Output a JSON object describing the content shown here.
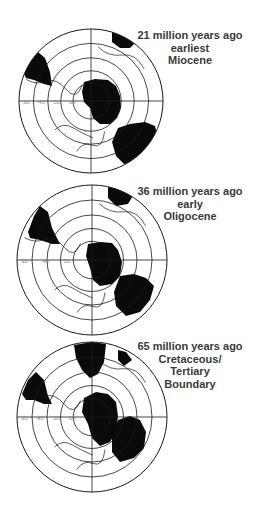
{
  "panels": [
    {
      "id": "miocene",
      "caption": [
        "21 million years ago",
        "earliest",
        "Miocene"
      ],
      "caption_pos": {
        "x": 131,
        "y": 29
      },
      "center": [
        91,
        101
      ],
      "radius": 72,
      "latitude_labels": [
        "30",
        "40",
        "50",
        "60"
      ],
      "land": [
        {
          "name": "antarctica",
          "points": "84,82 95,79 108,80 116,86 120,96 121,108 117,118 110,124 100,124 93,118 90,108 84,102 82,92"
        },
        {
          "name": "australia",
          "points": "118,128 130,124 145,122 155,126 158,138 150,152 138,162 124,164 116,156 112,142"
        },
        {
          "name": "africa",
          "points": "112,30 125,33 138,40 130,48 120,48 112,42"
        },
        {
          "name": "south-america",
          "points": "22,70 30,58 38,52 45,58 50,72 52,86 44,84 34,80 26,78"
        }
      ]
    },
    {
      "id": "oligocene",
      "caption": [
        "36 million years ago",
        "early",
        "Oligocene"
      ],
      "caption_pos": {
        "x": 131,
        "y": 185
      },
      "center": [
        92,
        260
      ],
      "radius": 75,
      "latitude_labels": [
        "30",
        "40",
        "50"
      ],
      "land": [
        {
          "name": "antarctica",
          "points": "88,244 100,242 112,243 118,250 122,262 120,276 112,284 100,286 93,280 90,268 86,256"
        },
        {
          "name": "australia",
          "points": "120,276 134,274 146,278 154,286 150,300 140,312 126,316 116,306 114,292"
        },
        {
          "name": "africa",
          "points": "108,186 120,186 134,194 128,204 116,206 108,198"
        },
        {
          "name": "south-america",
          "points": "28,232 34,216 40,206 48,212 52,228 60,244 52,244 40,240 30,238"
        }
      ]
    },
    {
      "id": "cretaceous",
      "caption": [
        "65 million years ago",
        "Cretaceous/",
        "Tertiary",
        "Boundary"
      ],
      "caption_pos": {
        "x": 131,
        "y": 340
      },
      "center": [
        92,
        417
      ],
      "radius": 75,
      "latitude_labels": [
        "30",
        "40",
        "50",
        "60"
      ],
      "land": [
        {
          "name": "antarctica",
          "points": "84,398 96,392 108,394 116,402 118,416 116,432 110,442 100,446 92,438 88,424 82,412"
        },
        {
          "name": "australia",
          "points": "118,420 130,416 140,420 146,432 144,448 134,458 120,462 112,452 112,436"
        },
        {
          "name": "africa",
          "points": "74,345 92,342 106,344 104,362 98,374 90,378 82,370 76,358"
        },
        {
          "name": "india",
          "points": "118,350 126,352 132,360 124,366 118,360"
        },
        {
          "name": "south-america",
          "points": "22,394 28,380 36,372 44,380 48,396 52,404 44,404 34,400 26,400"
        }
      ]
    }
  ],
  "style": {
    "line_color": "#1a1a1a",
    "land_color": "#0a0a0a",
    "label_color": "#888888"
  }
}
